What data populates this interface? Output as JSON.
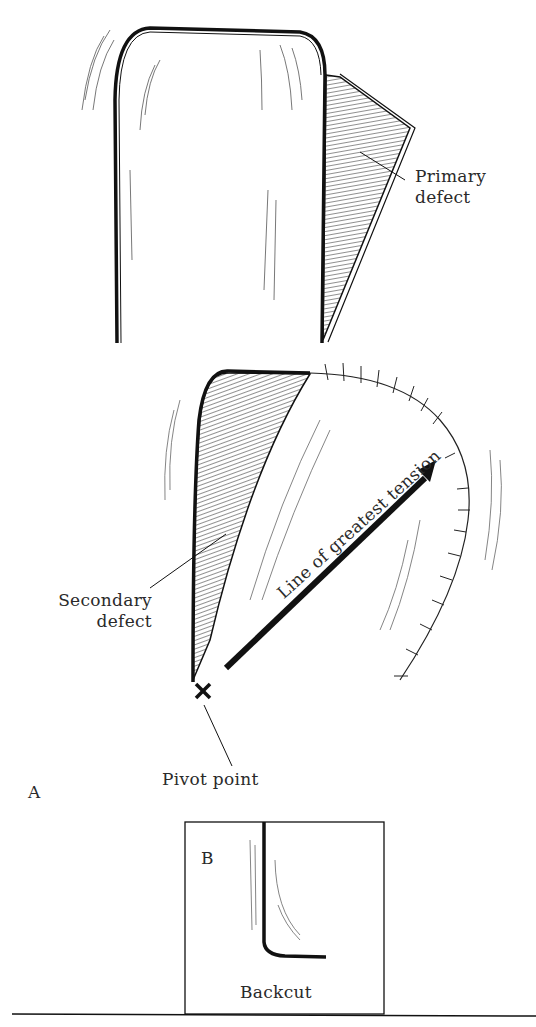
{
  "figure": {
    "panel_a": {
      "letter": "A",
      "labels": {
        "primary_defect": [
          "Primary",
          "defect"
        ],
        "secondary_defect": [
          "Secondary",
          "defect"
        ],
        "tension_line": "Line of greatest tension",
        "pivot_point": "Pivot point"
      }
    },
    "panel_b": {
      "letter": "B",
      "label": "Backcut"
    },
    "colors": {
      "ink": "#1a1a1a",
      "hatch": "#555555",
      "background": "#ffffff"
    }
  }
}
